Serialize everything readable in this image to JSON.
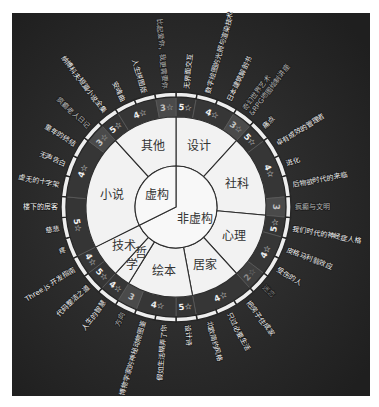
{
  "chart_data": {
    "type": "sunburst",
    "title": "",
    "clockwise": true,
    "start_angle_deg": 0,
    "leaf_value": 1,
    "data": [
      {
        "name": "非虚构",
        "children": [
          {
            "name": "设计",
            "ratings": [
              {
                "label": "5☆",
                "books": [
                  "无界面交互"
                ]
              },
              {
                "label": "4☆",
                "books": [
                  "数字绘图的光照与渲染技术",
                  "日本建筑解剖书"
                ]
              },
              {
                "label": "3☆",
                "books": [
                  "奇幻世界艺术\n&RPG地图绘制讲座"
                ]
              }
            ]
          },
          {
            "name": "社科",
            "ratings": [
              {
                "label": "5☆",
                "books": [
                  "痛点"
                ]
              },
              {
                "label": "4☆",
                "books": [
                  "卓有成效的管理者",
                  "进化",
                  "后物欲时代的来临"
                ]
              },
              {
                "label": "3",
                "books": [
                  "疯癫与文明"
                ]
              }
            ]
          },
          {
            "name": "心理",
            "ratings": [
              {
                "label": "5☆",
                "books": [
                  "我们时代的神经症人格"
                ]
              },
              {
                "label": "4☆",
                "books": [
                  "皮格马利翁效应",
                  "受伤的人"
                ]
              },
              {
                "label": "2☆",
                "books": [
                  "迷恋"
                ]
              }
            ]
          },
          {
            "name": "居家",
            "ratings": [
              {
                "label": "4☆",
                "books": [
                  "把房子住成家",
                  "只过必要生活",
                  "北欧简约风格"
                ]
              }
            ]
          },
          {
            "name": "绘本",
            "ratings": [
              {
                "label": "5☆",
                "books": [
                  "设计诗"
                ]
              },
              {
                "label": "4☆",
                "books": [
                  "假如生活糊弄了你",
                  "博物学家的神秘动物图鉴"
                ]
              },
              {
                "label": "3",
                "books": [
                  "方向"
                ]
              }
            ]
          },
          {
            "name": "哲学",
            "ratings": [
              {
                "label": "4☆",
                "books": [
                  "人生的智慧"
                ]
              }
            ]
          },
          {
            "name": "技术",
            "ratings": [
              {
                "label": "5☆",
                "books": [
                  "代码整洁之道"
                ]
              },
              {
                "label": "4☆",
                "books": [
                  "Three.js 开发指南"
                ]
              }
            ]
          }
        ]
      },
      {
        "name": "虚构",
        "children": [
          {
            "name": "小说",
            "ratings": [
              {
                "label": "5☆",
                "books": [
                  "疼",
                  "慈悲",
                  "楼下的房客"
                ]
              },
              {
                "label": "4☆",
                "books": [
                  "虚无的十字架",
                  "无声告白",
                  "童年的终结"
                ]
              },
              {
                "label": "3☆",
                "books": [
                  "疯癫老人日记"
                ]
              }
            ]
          },
          {
            "name": "其他",
            "ratings": [
              {
                "label": "5☆",
                "books": [
                  "纳博科夫短篇小说全集"
                ]
              },
              {
                "label": "4☆",
                "books": [
                  "安魂曲",
                  "人生拼图版"
                ]
              },
              {
                "label": "3☆",
                "books": [
                  "比起爱你，我更需要你"
                ]
              }
            ]
          }
        ]
      }
    ]
  },
  "colors": {
    "page_bg": "#ffffff",
    "chart_bg_center": "#3a3a3a",
    "chart_bg_edge": "#1f1f1f",
    "root_fill": "#f8f8f8",
    "category_fill": "#f2f2f2",
    "wedge_stroke": "#2e2e2e",
    "label_text": "#333333",
    "ring_stroke": "#5c5c5c",
    "book_band_fill": "#eeeeee",
    "book_band_gap": "#262626",
    "rating": {
      "5": {
        "ring": "#353535",
        "text": "#f2f2f2",
        "book_text": "#f2f2f2"
      },
      "4": {
        "ring": "#363636",
        "text": "#ececec",
        "book_text": "#eeeeee"
      },
      "3": {
        "ring": "#4a4a4a",
        "text": "#c2c2c2",
        "book_text": "#b0b0b0"
      },
      "2": {
        "ring": "#3f3f3f",
        "text": "#8a8a8a",
        "book_text": "#767676"
      }
    }
  }
}
